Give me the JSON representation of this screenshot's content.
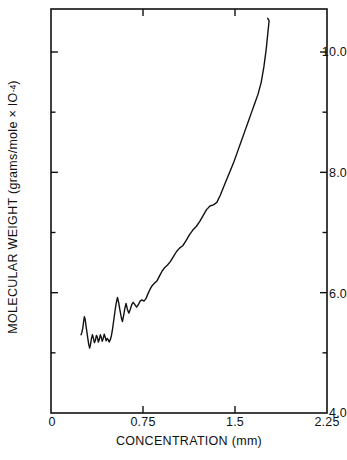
{
  "figure": {
    "background_color": "#ffffff",
    "ink_color": "#111111"
  },
  "axes": {
    "x_title": "CONCENTRATION  (mm)",
    "y_title_main": "MOLECULAR WEIGHT (grams/mole × IO",
    "y_title_exponent": "-4",
    "y_title_close": ")",
    "x_tick_labels": [
      "0",
      "0.75",
      "1.5",
      "2.25"
    ],
    "y_tick_labels": [
      "10.0",
      "8.0",
      "6.0",
      "4.0"
    ]
  },
  "chart_data": {
    "type": "line",
    "title": "",
    "subtitle": "",
    "xlabel": "CONCENTRATION  (mm)",
    "ylabel": "MOLECULAR WEIGHT (grams/mole × 10^-4)",
    "xlim": [
      0,
      2.25
    ],
    "ylim": [
      4.0,
      10.8
    ],
    "xticks": [
      0,
      0.75,
      1.5,
      2.25
    ],
    "yticks": [
      4.0,
      6.0,
      8.0,
      10.0
    ],
    "x_minor_ticks": [
      0.375,
      1.125,
      1.875
    ],
    "y_minor_ticks": [
      5.0,
      7.0,
      9.0
    ],
    "grid": false,
    "legend": null,
    "annotations": [],
    "series": [
      {
        "name": "molecular weight vs concentration",
        "color": "#111111",
        "line_width": 1.4,
        "x": [
          0.245,
          0.252,
          0.259,
          0.266,
          0.272,
          0.279,
          0.286,
          0.293,
          0.3,
          0.307,
          0.315,
          0.322,
          0.33,
          0.338,
          0.346,
          0.354,
          0.362,
          0.37,
          0.378,
          0.386,
          0.394,
          0.402,
          0.41,
          0.418,
          0.426,
          0.434,
          0.442,
          0.45,
          0.458,
          0.466,
          0.474,
          0.482,
          0.492,
          0.502,
          0.512,
          0.522,
          0.532,
          0.542,
          0.552,
          0.562,
          0.572,
          0.582,
          0.592,
          0.602,
          0.612,
          0.622,
          0.634,
          0.646,
          0.658,
          0.67,
          0.684,
          0.698,
          0.712,
          0.726,
          0.742,
          0.758,
          0.774,
          0.79,
          0.808,
          0.826,
          0.845,
          0.865,
          0.885,
          0.906,
          0.928,
          0.95,
          0.974,
          0.998,
          1.022,
          1.048,
          1.074,
          1.1,
          1.128,
          1.156,
          1.184,
          1.212,
          1.24,
          1.268,
          1.296,
          1.324,
          1.352,
          1.38,
          1.408,
          1.436,
          1.464,
          1.492,
          1.52,
          1.548,
          1.576,
          1.604,
          1.632,
          1.66,
          1.688,
          1.714,
          1.736,
          1.754,
          1.768,
          1.778,
          1.766
        ],
        "y": [
          5.3,
          5.34,
          5.41,
          5.52,
          5.6,
          5.55,
          5.44,
          5.34,
          5.24,
          5.15,
          5.08,
          5.14,
          5.24,
          5.3,
          5.24,
          5.17,
          5.21,
          5.29,
          5.26,
          5.18,
          5.22,
          5.3,
          5.26,
          5.19,
          5.24,
          5.31,
          5.26,
          5.2,
          5.24,
          5.22,
          5.18,
          5.21,
          5.28,
          5.4,
          5.55,
          5.7,
          5.83,
          5.92,
          5.83,
          5.71,
          5.6,
          5.52,
          5.62,
          5.74,
          5.82,
          5.73,
          5.66,
          5.72,
          5.8,
          5.84,
          5.8,
          5.76,
          5.8,
          5.86,
          5.88,
          5.86,
          5.9,
          5.98,
          6.06,
          6.12,
          6.16,
          6.2,
          6.28,
          6.36,
          6.42,
          6.46,
          6.52,
          6.6,
          6.68,
          6.74,
          6.78,
          6.86,
          6.96,
          7.04,
          7.1,
          7.18,
          7.28,
          7.38,
          7.44,
          7.46,
          7.5,
          7.62,
          7.76,
          7.9,
          8.04,
          8.18,
          8.34,
          8.5,
          8.66,
          8.82,
          8.98,
          9.14,
          9.3,
          9.5,
          9.76,
          10.04,
          10.32,
          10.52,
          10.56
        ]
      }
    ]
  },
  "geometry": {
    "plot_left_px": 51,
    "plot_right_px": 327,
    "plot_top_px": 9,
    "plot_bottom_px": 413
  }
}
